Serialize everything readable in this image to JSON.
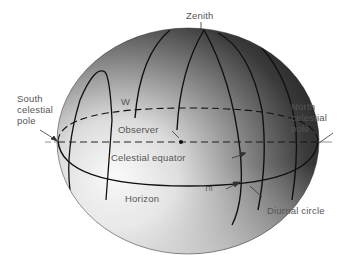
{
  "diagram": {
    "type": "celestial-sphere",
    "labels": {
      "zenith": "Zenith",
      "south_pole": "South\ncelestial\npole",
      "north_pole": "North\ncelestial\npole",
      "west": "W",
      "east": "E",
      "observer": "Observer",
      "celestial_equator": "Celestial equator",
      "horizon": "Horizon",
      "diurnal_circle": "Diurnal circle"
    },
    "colors": {
      "sphere_light": "#f4f4f4",
      "sphere_dark": "#1a1a1a",
      "line": "#111111",
      "text": "#555555"
    }
  }
}
